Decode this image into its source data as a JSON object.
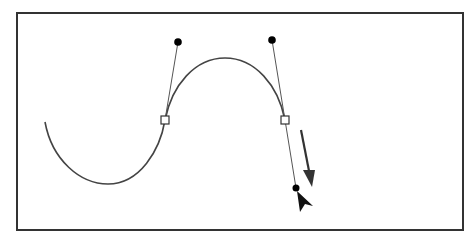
{
  "diagram": {
    "colors": {
      "background": "#ffffff",
      "frame": "#333333",
      "curve": "#444444",
      "handle_line": "#555555",
      "handle_point": "#000000",
      "anchor_fill": "#ffffff",
      "anchor_stroke": "#333333",
      "direction_arrow": "#333333",
      "cursor": "#111111"
    },
    "frame": {
      "x": 17,
      "y": 13,
      "width": 446,
      "height": 217
    },
    "curve_path": "M 45 122 C 52 160, 80 184, 108 184 C 140 184, 160 150, 165 120 C 172 85, 195 58, 225 58 C 255 58, 278 85, 285 120",
    "anchors": [
      {
        "name": "anchor-point-left",
        "x": 165,
        "y": 120
      },
      {
        "name": "anchor-point-right",
        "x": 285,
        "y": 120
      }
    ],
    "handles": [
      {
        "name": "handle-left-top",
        "x1": 165,
        "y1": 120,
        "x2": 178,
        "y2": 42
      },
      {
        "name": "handle-right-top",
        "x1": 285,
        "y1": 120,
        "x2": 272,
        "y2": 40
      },
      {
        "name": "handle-right-bottom",
        "x1": 285,
        "y1": 120,
        "x2": 296,
        "y2": 188
      }
    ],
    "direction_arrow": {
      "x1": 301,
      "y1": 130,
      "x2": 311,
      "y2": 184
    },
    "cursor": {
      "x": 297,
      "y": 192
    }
  }
}
